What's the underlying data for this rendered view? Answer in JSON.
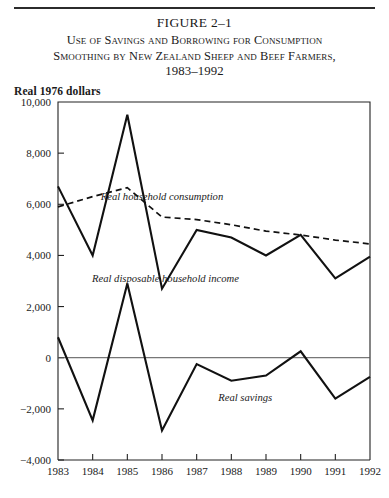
{
  "figure": {
    "number_label": "FIGURE 2–1",
    "title_line1": "Use of Savings and Borrowing for Consumption",
    "title_line2": "Smoothing by New Zealand Sheep and Beef Farmers,",
    "title_line3": "1983–1992",
    "units_label": "Real 1976 dollars"
  },
  "chart_data": {
    "type": "line",
    "xlabel": "",
    "ylabel": "Real 1976 dollars",
    "x": [
      1983,
      1984,
      1985,
      1986,
      1987,
      1988,
      1989,
      1990,
      1991,
      1992
    ],
    "categories": [
      "1983",
      "1984",
      "1985",
      "1986",
      "1987",
      "1988",
      "1989",
      "1990",
      "1991",
      "1992"
    ],
    "xlim": [
      1983,
      1992
    ],
    "ylim": [
      -4000,
      10000
    ],
    "yticks": [
      -4000,
      -2000,
      0,
      2000,
      4000,
      6000,
      8000,
      10000
    ],
    "ytick_labels": [
      "−4,000",
      "−2,000",
      "0",
      "2,000",
      "4,000",
      "6,000",
      "8,000",
      "10,000"
    ],
    "grid": false,
    "legend_position": "inline-annotations",
    "zero_line": true,
    "series": [
      {
        "name": "Real disposable household income",
        "style": "solid",
        "values": [
          6700,
          4000,
          9500,
          2700,
          5000,
          4700,
          4000,
          4800,
          3100,
          3950
        ]
      },
      {
        "name": "Real household consumption",
        "style": "dashed",
        "values": [
          5900,
          6300,
          6650,
          5500,
          5400,
          5200,
          4950,
          4800,
          4600,
          4450
        ]
      },
      {
        "name": "Real savings",
        "style": "solid",
        "values": [
          800,
          -2450,
          2900,
          -2850,
          -250,
          -900,
          -700,
          250,
          -1600,
          -750
        ]
      }
    ],
    "annotations": [
      {
        "text": "Real household consumption",
        "x": 1986.0,
        "y": 6150
      },
      {
        "text": "Real disposable household income",
        "x": 1986.1,
        "y": 2950
      },
      {
        "text": "Real savings",
        "x": 1988.4,
        "y": -1700
      }
    ]
  }
}
